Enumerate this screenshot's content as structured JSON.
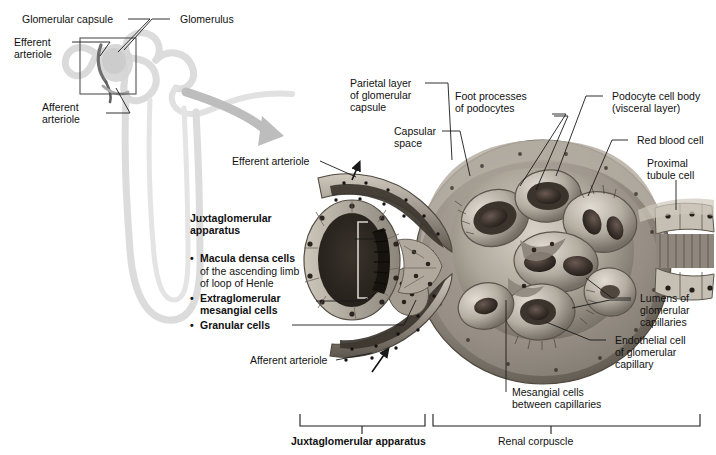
{
  "figure": {
    "colors": {
      "ink": "#111111",
      "leader": "#1a1a1a",
      "nephron_outline": "#cfcfcf",
      "magnify_arrow": "#b8b8b8",
      "tissue_light": "#cfc9c0",
      "tissue_mid": "#8d867c",
      "tissue_dark": "#4a453e",
      "lumen_dark": "#2e2a25",
      "rbc": "#3a2f2b",
      "capsule_rim": "#9a9288"
    }
  },
  "overview_panel": {
    "labels": [
      {
        "id": "glomerular-capsule",
        "text": "Glomerular capsule"
      },
      {
        "id": "glomerulus",
        "text": "Glomerulus"
      },
      {
        "id": "efferent-arteriole",
        "text": "Efferent\narteriole"
      },
      {
        "id": "afferent-arteriole",
        "text": "Afferent\narteriole"
      }
    ]
  },
  "detail_panel": {
    "labels": [
      {
        "id": "parietal-layer",
        "text": "Parietal layer\nof glomerular\ncapsule"
      },
      {
        "id": "capsular-space",
        "text": "Capsular\nspace"
      },
      {
        "id": "foot-processes",
        "text": "Foot processes\nof podocytes"
      },
      {
        "id": "podocyte-cell-body",
        "text": "Podocyte cell body\n(visceral layer)"
      },
      {
        "id": "red-blood-cell",
        "text": "Red blood cell"
      },
      {
        "id": "proximal-tubule-cell",
        "text": "Proximal\ntubule cell"
      },
      {
        "id": "lumens-glomerular-capillaries",
        "text": "Lumens of\nglomerular\ncapillaries"
      },
      {
        "id": "endothelial-cell",
        "text": "Endothelial cell\nof glomerular\ncapillary"
      },
      {
        "id": "mesangial-cells",
        "text": "Mesangial cells\nbetween capillaries"
      },
      {
        "id": "efferent-arteriole-detail",
        "text": "Efferent arteriole"
      },
      {
        "id": "afferent-arteriole-detail",
        "text": "Afferent arteriole"
      }
    ]
  },
  "jga_legend": {
    "heading": "Juxtaglomerular\napparatus",
    "items": [
      {
        "bold": "Macula densa cells",
        "plain": "of the ascending limb\nof loop of Henle"
      },
      {
        "bold": "Extraglomerular\nmesangial cells",
        "plain": ""
      },
      {
        "bold": "Granular cells",
        "plain": ""
      }
    ],
    "bullet": "•"
  },
  "brackets": [
    {
      "id": "bracket-jga",
      "label": "Juxtaglomerular apparatus",
      "bold": true
    },
    {
      "id": "bracket-renal-corpuscle",
      "label": "Renal corpuscle",
      "bold": false
    }
  ]
}
